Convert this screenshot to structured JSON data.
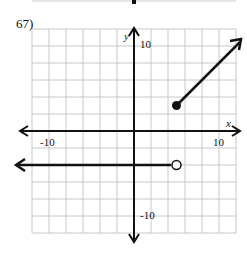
{
  "problem": {
    "number": "67)"
  },
  "chart_data": {
    "type": "line",
    "title": "",
    "xlabel": "x",
    "ylabel": "y",
    "xlim": [
      -12,
      12
    ],
    "ylim": [
      -12,
      12
    ],
    "grid": true,
    "grid_step": 2,
    "tick_labels": {
      "x_neg": "-10",
      "x_pos": "10",
      "y_pos": "10",
      "y_neg": "-10"
    },
    "series": [
      {
        "name": "piece-1",
        "kind": "ray",
        "equation": "y = -4 for x < 5",
        "start": [
          5,
          -4
        ],
        "endpoint": "open",
        "direction": "left",
        "slope": 0
      },
      {
        "name": "piece-2",
        "kind": "ray",
        "equation": "y = x - 2 for x >= 5",
        "start": [
          5,
          3
        ],
        "endpoint": "closed",
        "direction": "up-right",
        "slope": 1
      }
    ],
    "colors": {
      "grid": "#c8c8c8",
      "axis": "#111111",
      "graph": "#111111"
    }
  }
}
